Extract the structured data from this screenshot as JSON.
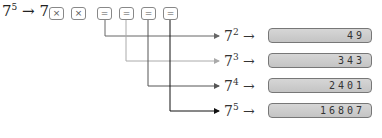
{
  "title": {
    "base": "7",
    "exp": "5",
    "arrow": "→",
    "operand": "7"
  },
  "keys": [
    {
      "label": "×",
      "left": 49
    },
    {
      "label": "×",
      "left": 71
    },
    {
      "label": "=",
      "left": 97
    },
    {
      "label": "=",
      "left": 119
    },
    {
      "label": "=",
      "left": 141
    },
    {
      "label": "=",
      "left": 163
    }
  ],
  "rows": [
    {
      "base": "7",
      "exp": "2",
      "arrow": "→",
      "value": "49",
      "line_color": "#666666"
    },
    {
      "base": "7",
      "exp": "3",
      "arrow": "→",
      "value": "343",
      "line_color": "#aaaaaa"
    },
    {
      "base": "7",
      "exp": "4",
      "arrow": "→",
      "value": "2401",
      "line_color": "#555555"
    },
    {
      "base": "7",
      "exp": "5",
      "arrow": "→",
      "value": "16807",
      "line_color": "#111111"
    }
  ]
}
